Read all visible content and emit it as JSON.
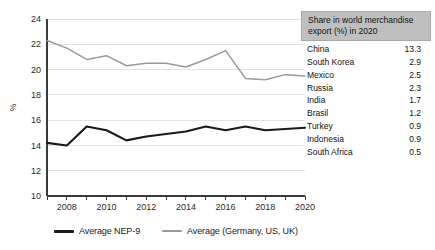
{
  "chart_data": {
    "type": "line",
    "title": "",
    "xlabel": "",
    "ylabel": "%",
    "xlim": [
      2007,
      2020
    ],
    "ylim": [
      10,
      24
    ],
    "ytick_step": 2,
    "yticks": [
      10,
      12,
      14,
      16,
      18,
      20,
      22,
      24
    ],
    "xticks": [
      2007,
      2008,
      2009,
      2010,
      2011,
      2012,
      2013,
      2014,
      2015,
      2016,
      2017,
      2018,
      2019,
      2020
    ],
    "xtick_labels": [
      "",
      "2008",
      "",
      "2010",
      "",
      "2012",
      "",
      "2014",
      "",
      "2016",
      "",
      "2018",
      "",
      "2020"
    ],
    "grid": true,
    "grid_axis": "y",
    "legend_position": "bottom",
    "x": [
      2007,
      2008,
      2009,
      2010,
      2011,
      2012,
      2013,
      2014,
      2015,
      2016,
      2017,
      2018,
      2019,
      2020
    ],
    "series": [
      {
        "name": "Average NEP-9",
        "color": "#1a1a1a",
        "width": 2.1,
        "values": [
          14.2,
          14.0,
          15.5,
          15.2,
          14.4,
          14.7,
          14.9,
          15.1,
          15.5,
          15.2,
          15.5,
          15.2,
          15.3,
          15.4
        ]
      },
      {
        "name": "Average (Germany, US, UK)",
        "color": "#9a9a9a",
        "width": 1.5,
        "values": [
          22.3,
          21.7,
          20.8,
          21.1,
          20.3,
          20.5,
          20.5,
          20.2,
          20.8,
          21.5,
          19.3,
          19.2,
          19.6,
          19.5
        ]
      }
    ]
  },
  "legend": {
    "items": [
      {
        "label": "Average NEP-9",
        "color": "#1a1a1a",
        "thickness": 3
      },
      {
        "label": "Average (Germany, US, UK)",
        "color": "#9a9a9a",
        "thickness": 2.5
      }
    ]
  },
  "side_table": {
    "header": "Share in world merchandise export (%) in 2020",
    "header_bg": "#bfbfbf",
    "rows": [
      {
        "country": "China",
        "value": "13.3"
      },
      {
        "country": "South Korea",
        "value": "2.9"
      },
      {
        "country": "Mexico",
        "value": "2.5"
      },
      {
        "country": "Russia",
        "value": "2.3"
      },
      {
        "country": "India",
        "value": "1.7"
      },
      {
        "country": "Brasil",
        "value": "1.2"
      },
      {
        "country": "Turkey",
        "value": "0.9"
      },
      {
        "country": "Indonesia",
        "value": "0.9"
      },
      {
        "country": "South Africa",
        "value": "0.5"
      }
    ]
  }
}
